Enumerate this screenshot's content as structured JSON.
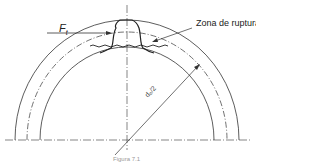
{
  "labels": {
    "force": "F",
    "force_sub": "t",
    "zone": "Zona de ruptura",
    "radius": "d₀/2",
    "caption": "Figura 7.1"
  },
  "colors": {
    "line": "#333333",
    "background": "#ffffff"
  }
}
